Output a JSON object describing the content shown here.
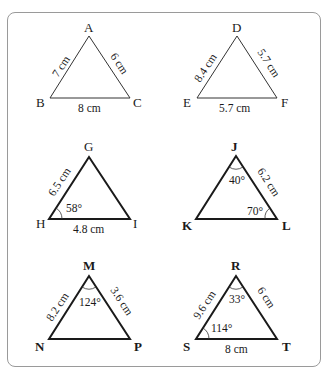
{
  "triangles": [
    {
      "id": "ABC",
      "vertices": {
        "top": "A",
        "left": "B",
        "right": "C"
      },
      "sides": {
        "left": "7 cm",
        "right": "6 cm",
        "base": "8 cm"
      },
      "angles": {}
    },
    {
      "id": "DEF",
      "vertices": {
        "top": "D",
        "left": "E",
        "right": "F"
      },
      "sides": {
        "left": "8.4 cm",
        "right": "5.7 cm",
        "base": "5.7 cm"
      },
      "angles": {}
    },
    {
      "id": "GHI",
      "vertices": {
        "top": "G",
        "left": "H",
        "right": "I"
      },
      "sides": {
        "left": "6.5 cm",
        "base": "4.8 cm"
      },
      "angles": {
        "left": "58°"
      }
    },
    {
      "id": "JKL",
      "vertices": {
        "top": "J",
        "left": "K",
        "right": "L"
      },
      "sides": {
        "right": "6.2 cm"
      },
      "angles": {
        "top": "40°",
        "right": "70°"
      }
    },
    {
      "id": "MNP",
      "vertices": {
        "top": "M",
        "left": "N",
        "right": "P"
      },
      "sides": {
        "left": "8.2 cm",
        "right": "3.6 cm"
      },
      "angles": {
        "top": "124°"
      }
    },
    {
      "id": "RST",
      "vertices": {
        "top": "R",
        "left": "S",
        "right": "T"
      },
      "sides": {
        "left": "9.6 cm",
        "right": "6 cm",
        "base": "8 cm"
      },
      "angles": {
        "top": "33°",
        "left": "114°"
      }
    }
  ]
}
